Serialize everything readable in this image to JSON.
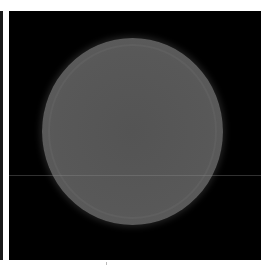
{
  "image": {
    "description": "Grayscale circular disk on black background",
    "colors": {
      "background": "#000000",
      "disk": "#585858",
      "frame": "#ffffff"
    }
  }
}
